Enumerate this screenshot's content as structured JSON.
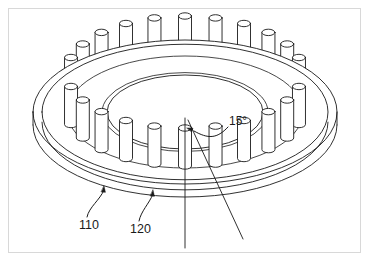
{
  "figure": {
    "background_color": "#ffffff",
    "frame_color": "#d8d8d8",
    "line_color": "#1a1a1a",
    "fill_color": "#ffffff"
  },
  "labels": {
    "disc_ref": "110",
    "pin_ref": "120",
    "angle": "15°"
  },
  "geometry": {
    "center_x": 185,
    "center_y": 112,
    "outer_rx": 152,
    "outer_ry": 72,
    "inner_rx": 78,
    "inner_ry": 37,
    "pin_ring_rx": 118,
    "pin_ring_ry": 56,
    "disc_thickness": 13,
    "rim_inner_offset": 9,
    "pin_count": 24,
    "pin_half_width": 6.5,
    "pin_height": 40,
    "pin_cap_ry": 3.2,
    "angle_step_deg": 15
  },
  "axis": {
    "vertical_top_x": 185,
    "vertical_top_y": 118,
    "vertical_bottom_x": 185,
    "vertical_bottom_y": 248,
    "slant_top_x": 188,
    "slant_top_y": 120,
    "slant_bottom_x": 243,
    "slant_bottom_y": 239,
    "vertex_x": 186,
    "vertex_y": 121
  },
  "leaders": {
    "disc": {
      "text_x": 79,
      "text_y": 229,
      "arrow_x": 104,
      "arrow_y": 186
    },
    "pin": {
      "text_x": 130,
      "text_y": 233,
      "arrow_x": 153,
      "arrow_y": 190
    },
    "angle": {
      "text_x": 229,
      "text_y": 125,
      "arrow_x": 192,
      "arrow_y": 131
    }
  }
}
